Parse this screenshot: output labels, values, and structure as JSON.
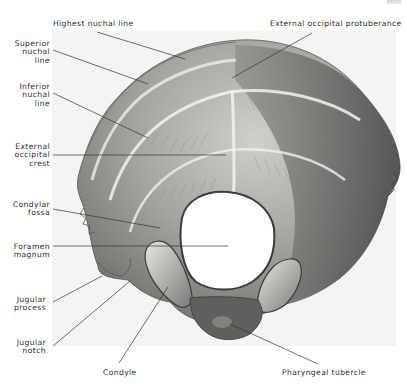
{
  "figure": {
    "labels": {
      "highest_nuchal_line": "Highest nuchal line",
      "external_occipital_protuberance": "External occipital protuberance",
      "superior_nuchal_line": "Superior\nnuchal\nline",
      "inferior_nuchal_line": "Inferior\nnuchal\nline",
      "external_occipital_crest": "External\noccipital\ncrest",
      "condylar_fossa": "Condylar\nfossa",
      "foramen_magnum": "Foramen\nmagnum",
      "jugular_process": "Jugular\nprocess",
      "jugular_notch": "Jugular\nnotch",
      "condyle": "Condyle",
      "pharyngeal_tubercle": "Pharyngeal tubercle"
    },
    "colors": {
      "background": "#ffffff",
      "plate": "#f4f4f2",
      "bone_light": "#d9d9d6",
      "bone_mid": "#9a9a97",
      "bone_dark": "#4a4a48",
      "leader_line": "#333333",
      "text": "#2b2b2b"
    }
  }
}
